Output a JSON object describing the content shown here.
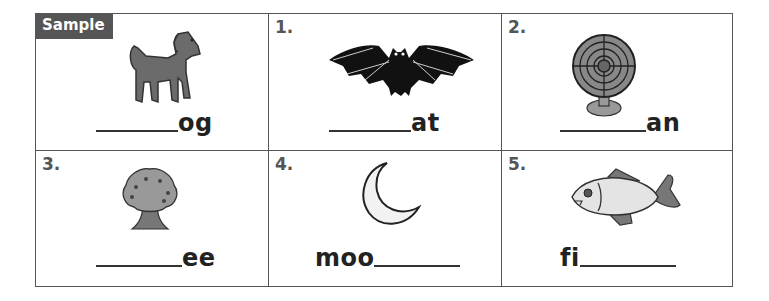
{
  "worksheet": {
    "cells": [
      {
        "label": "Sample",
        "picture": "dog",
        "prefix": "",
        "suffix": "og",
        "blank_position": "start"
      },
      {
        "label": "1.",
        "picture": "bat",
        "prefix": "",
        "suffix": "at",
        "blank_position": "start"
      },
      {
        "label": "2.",
        "picture": "fan",
        "prefix": "",
        "suffix": "an",
        "blank_position": "start"
      },
      {
        "label": "3.",
        "picture": "tree",
        "prefix": "",
        "suffix": "ee",
        "blank_position": "start"
      },
      {
        "label": "4.",
        "picture": "moon",
        "prefix": "moo",
        "suffix": "",
        "blank_position": "end"
      },
      {
        "label": "5.",
        "picture": "fish",
        "prefix": "fi",
        "suffix": "",
        "blank_position": "end"
      }
    ],
    "colors": {
      "border": "#555555",
      "sample_bg": "#555555",
      "text": "#222222"
    }
  }
}
